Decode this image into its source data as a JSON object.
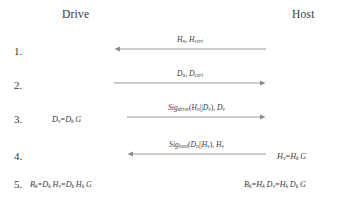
{
  "diagram": {
    "title_drive": "Drive",
    "title_host": "Host",
    "participants": [
      "Drive",
      "Host"
    ],
    "steps": [
      {
        "number": "1.",
        "message": "Hₙ, H_cert",
        "message_plain": "Hn, Hcert",
        "direction": "host-to-drive",
        "arrow": "left",
        "left_expr": "",
        "right_expr": ""
      },
      {
        "number": "2.",
        "message": "Dₙ, D_cert",
        "message_plain": "Dn, Dcert",
        "direction": "drive-to-host",
        "arrow": "right",
        "left_expr": "",
        "right_expr": ""
      },
      {
        "number": "3.",
        "message": "Sig_drive(Hₙ||Dᵥ), Dᵥ",
        "message_plain": "Sigdrive(Hn||Dv), Dv",
        "direction": "drive-to-host",
        "arrow": "right",
        "left_expr": "Dᵥ=DₖG",
        "right_expr": ""
      },
      {
        "number": "4.",
        "message": "Sig_host(Dₙ||Hᵥ), Hᵥ",
        "message_plain": "Sighost(Dn||Hv), Hv",
        "direction": "host-to-drive",
        "arrow": "left",
        "left_expr": "",
        "right_expr": "Hᵥ=HₖG"
      },
      {
        "number": "5.",
        "message": "",
        "message_plain": "",
        "direction": "none",
        "arrow": "none",
        "left_expr": "Bₖ=DₖHᵥ=DₖHₖG",
        "right_expr": "Bₖ=HₖDᵥ=HₖDₖG"
      }
    ],
    "colors": {
      "background": "#ffffff",
      "text": "#3c3c3c",
      "line": "#8c8c8c"
    }
  }
}
